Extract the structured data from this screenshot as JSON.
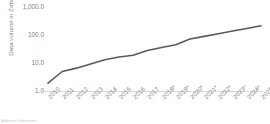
{
  "chart_data": {
    "type": "line",
    "title": "",
    "xlabel": "",
    "ylabel": "Data volume in Zettabytes",
    "yscale": "log",
    "ylim": [
      1.0,
      1000.0
    ],
    "grid": false,
    "legend": "none",
    "line_color": "#595959",
    "categories": [
      "2010",
      "2011",
      "2012",
      "2013",
      "2014",
      "2015",
      "2016",
      "2017",
      "2018*",
      "2019*",
      "2020*",
      "2021*",
      "2022*",
      "2023*",
      "2024*",
      "2025*"
    ],
    "values": [
      2,
      5,
      6.5,
      9,
      12.5,
      15.5,
      18,
      26,
      33,
      41,
      64,
      79,
      97,
      120,
      147,
      181
    ],
    "ytick_labels": [
      "1,000.0",
      "100.0",
      "10.0",
      "1.0"
    ],
    "ytick_values": [
      1000.0,
      100.0,
      10.0,
      1.0
    ],
    "annotations": {
      "asterisk_note": "* denotes forecast values"
    }
  },
  "axis": {
    "y_title": "Data volume in Zettabytes"
  },
  "footnote": {
    "text": "Additional Information:"
  },
  "colors": {
    "line": "#595959",
    "axis_line": "#d9d9d9",
    "tick_text": "#808080",
    "title_text": "#7f7f7f",
    "background": "#ffffff"
  }
}
